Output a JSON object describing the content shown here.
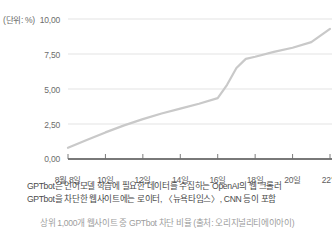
{
  "unit_label": "(단위: %)",
  "chart_data": {
    "type": "line",
    "title": "",
    "xlabel": "",
    "ylabel": "",
    "unit": "%",
    "grid": true,
    "legend": "none",
    "ylim": [
      0,
      10
    ],
    "ytick_labels": [
      "10,00",
      "7,50",
      "5,00",
      "2,50",
      "0,00"
    ],
    "ytick_values": [
      10.0,
      7.5,
      5.0,
      2.5,
      0.0
    ],
    "xtick_labels": [
      "8월 8일",
      "10일",
      "12일",
      "14일",
      "16일",
      "18일",
      "20일",
      "22일"
    ],
    "xtick_values": [
      8,
      10,
      12,
      14,
      16,
      18,
      20,
      22
    ],
    "xlim": [
      8,
      22
    ],
    "series": [
      {
        "name": "GPTbot 차단 웹사이트 비율",
        "color": "#c9c9c9",
        "x": [
          8,
          9,
          10,
          11,
          12,
          13,
          14,
          15,
          16,
          16.5,
          17,
          17.5,
          18,
          19,
          20,
          21,
          22
        ],
        "values": [
          0.8,
          1.35,
          1.9,
          2.4,
          2.85,
          3.25,
          3.6,
          3.95,
          4.35,
          5.3,
          6.5,
          7.15,
          7.3,
          7.65,
          7.95,
          8.35,
          9.3
        ]
      }
    ]
  },
  "caption": {
    "lines": [
      "GPTbot은 언어모델 학습에 필요한 데이터를 수집하는 OpenAI의 웹 크롤러",
      "GPTbot을 차단한 웹사이트에는 로이터, 〈뉴욕타임스〉, CNN 등이 포함"
    ]
  },
  "footer_note": {
    "text": "상위 1,000개 웹사이트 중 GPTbot 차단 비율 (출처: 오리지널리티에이아이)"
  }
}
